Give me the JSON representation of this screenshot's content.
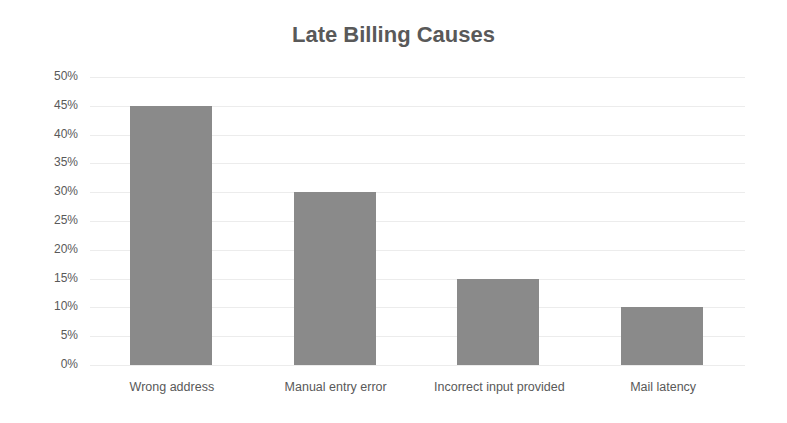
{
  "chart_data": {
    "type": "bar",
    "title": "Late Billing Causes",
    "categories": [
      "Wrong address",
      "Manual entry error",
      "Incorrect input provided",
      "Mail latency"
    ],
    "values": [
      45,
      30,
      15,
      10
    ],
    "value_format": "percent",
    "xlabel": "",
    "ylabel": "",
    "ylim": [
      0,
      50
    ],
    "yticks": [
      "0%",
      "5%",
      "10%",
      "15%",
      "20%",
      "25%",
      "30%",
      "35%",
      "40%",
      "45%",
      "50%"
    ],
    "grid": true,
    "legend": null,
    "bar_color": "#8a8a8a"
  }
}
